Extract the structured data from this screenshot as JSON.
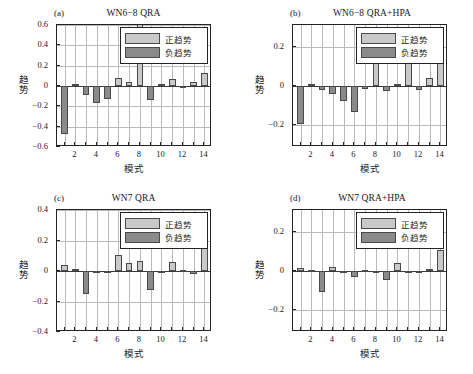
{
  "figure": {
    "background": "#ffffff",
    "positive_color": "#c9c9c9",
    "negative_color": "#8a8a8a",
    "axis_color": "#232323",
    "grid_color": "#b9b9b9"
  },
  "legend": {
    "positive_label": "正趋势",
    "negative_label": "负趋势"
  },
  "axis": {
    "xlabel": "模式",
    "ylabel": "趋势",
    "xticks": [
      "2",
      "4",
      "6",
      "8",
      "10",
      "12",
      "14"
    ],
    "yticks_6": [
      "0.6",
      "0.4",
      "0.2",
      "0",
      "-0.2",
      "-0.4",
      "-0.6"
    ],
    "yticks_4": [
      "0.4",
      "0.2",
      "0",
      "-0.2",
      "-0.4"
    ],
    "yticks_3": [
      "0.2",
      "0",
      "-0.2"
    ]
  },
  "panels": {
    "a": {
      "tag": "(a)",
      "title": "WN6−8 QRA"
    },
    "b": {
      "tag": "(b)",
      "title": "WN6−8 QRA+HPA"
    },
    "c": {
      "tag": "(c)",
      "title": "WN7 QRA"
    },
    "d": {
      "tag": "(d)",
      "title": "WN7 QRA+HPA"
    }
  },
  "chart_data": [
    {
      "type": "bar",
      "panel": "a",
      "title": "WN6−8 QRA",
      "tag": "(a)",
      "xlabel": "模式",
      "ylabel": "趋势",
      "categories": [
        1,
        2,
        3,
        4,
        5,
        6,
        7,
        8,
        9,
        10,
        11,
        12,
        13,
        14
      ],
      "values": [
        -0.475,
        0.018,
        -0.085,
        -0.165,
        -0.125,
        0.078,
        0.037,
        0.62,
        -0.135,
        0.018,
        0.067,
        -0.008,
        0.04,
        0.132
      ],
      "xlim": [
        0.3,
        14.7
      ],
      "ylim": [
        -0.6,
        0.6
      ],
      "yticks": [
        -0.6,
        -0.4,
        -0.2,
        0,
        0.2,
        0.4,
        0.6
      ],
      "xticks": [
        2,
        4,
        6,
        8,
        10,
        12,
        14
      ],
      "grid": true,
      "legend": [
        "正趋势",
        "负趋势"
      ],
      "legend_position": "upper right"
    },
    {
      "type": "bar",
      "panel": "b",
      "title": "WN6−8 QRA+HPA",
      "tag": "(b)",
      "xlabel": "模式",
      "ylabel": "趋势",
      "categories": [
        1,
        2,
        3,
        4,
        5,
        6,
        7,
        8,
        9,
        10,
        11,
        12,
        13,
        14
      ],
      "values": [
        -0.192,
        0.012,
        -0.018,
        -0.042,
        -0.078,
        -0.132,
        -0.017,
        0.225,
        -0.027,
        0.012,
        0.255,
        -0.018,
        0.042,
        0.27
      ],
      "xlim": [
        0.3,
        14.7
      ],
      "ylim": [
        -0.31,
        0.31
      ],
      "yticks": [
        -0.2,
        0,
        0.2
      ],
      "xticks": [
        2,
        4,
        6,
        8,
        10,
        12,
        14
      ],
      "grid": true,
      "legend": [
        "正趋势",
        "负趋势"
      ],
      "legend_position": "upper right"
    },
    {
      "type": "bar",
      "panel": "c",
      "title": "WN7 QRA",
      "tag": "(c)",
      "xlabel": "模式",
      "ylabel": "趋势",
      "categories": [
        1,
        2,
        3,
        4,
        5,
        6,
        7,
        8,
        9,
        10,
        11,
        12,
        13,
        14
      ],
      "values": [
        0.042,
        0.015,
        -0.148,
        0.0,
        -0.01,
        0.102,
        0.05,
        0.065,
        -0.122,
        0.0,
        0.06,
        0.005,
        -0.018,
        0.245
      ],
      "xlim": [
        0.3,
        14.7
      ],
      "ylim": [
        -0.4,
        0.4
      ],
      "yticks": [
        -0.4,
        -0.2,
        0,
        0.2,
        0.4
      ],
      "xticks": [
        2,
        4,
        6,
        8,
        10,
        12,
        14
      ],
      "grid": true,
      "legend": [
        "正趋势",
        "负趋势"
      ],
      "legend_position": "upper right"
    },
    {
      "type": "bar",
      "panel": "d",
      "title": "WN7 QRA+HPA",
      "tag": "(d)",
      "xlabel": "模式",
      "ylabel": "趋势",
      "categories": [
        1,
        2,
        3,
        4,
        5,
        6,
        7,
        8,
        9,
        10,
        11,
        12,
        13,
        14
      ],
      "values": [
        0.017,
        0.005,
        -0.105,
        0.022,
        -0.004,
        -0.032,
        0.006,
        -0.005,
        -0.048,
        0.042,
        -0.004,
        -0.006,
        0.01,
        0.105
      ],
      "xlim": [
        0.3,
        14.7
      ],
      "ylim": [
        -0.31,
        0.31
      ],
      "yticks": [
        -0.2,
        0,
        0.2
      ],
      "xticks": [
        2,
        4,
        6,
        8,
        10,
        12,
        14
      ],
      "grid": true,
      "legend": [
        "正趋势",
        "负趋势"
      ],
      "legend_position": "upper right"
    }
  ]
}
